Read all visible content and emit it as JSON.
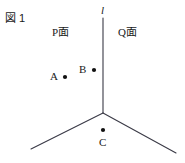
{
  "figure": {
    "caption": "図 1",
    "width": 185,
    "height": 163,
    "background_color": "#ffffff",
    "stroke_color": "#3a3a46",
    "dot_color": "#111111"
  },
  "labels": {
    "line_l": "l",
    "plane_p": "P面",
    "plane_q": "Q面",
    "point_a": "A",
    "point_b": "B",
    "point_c": "C"
  },
  "geometry": {
    "junction": {
      "x": 103,
      "y": 113
    },
    "lines": [
      {
        "name": "line-l-vertical",
        "x1": 103,
        "y1": 18,
        "x2": 103,
        "y2": 113
      },
      {
        "name": "plane-p-edge-left",
        "x1": 103,
        "y1": 113,
        "x2": 31,
        "y2": 149
      },
      {
        "name": "plane-q-edge-right",
        "x1": 103,
        "y1": 113,
        "x2": 176,
        "y2": 153
      }
    ],
    "points": [
      {
        "name": "point-a",
        "label": "A",
        "x": 65,
        "y": 77
      },
      {
        "name": "point-b",
        "label": "B",
        "x": 94,
        "y": 70
      },
      {
        "name": "point-c",
        "label": "C",
        "x": 103,
        "y": 130
      }
    ]
  }
}
